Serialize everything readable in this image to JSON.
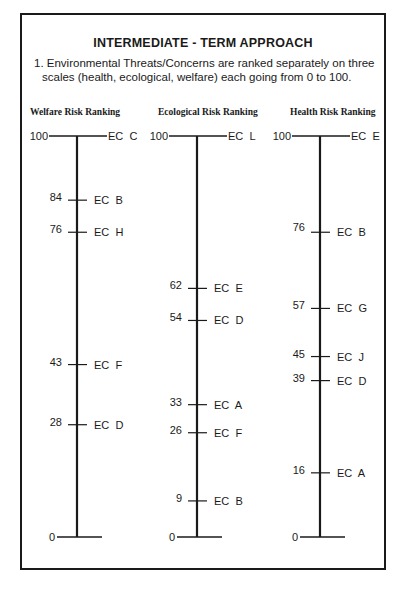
{
  "title": "INTERMEDIATE - TERM APPROACH",
  "description": {
    "line1": "1. Environmental Threats/Concerns are ranked separately on three",
    "line2": "scales (health, ecological, welfare) each going from 0 to 100."
  },
  "chart_data": {
    "type": "diagram",
    "title": "INTERMEDIATE - TERM APPROACH",
    "range": [
      0,
      100
    ],
    "scales": [
      {
        "name": "Welfare Risk Ranking",
        "items": [
          {
            "value": 100,
            "label": "EC  C"
          },
          {
            "value": 84,
            "label": "EC  B"
          },
          {
            "value": 76,
            "label": "EC  H"
          },
          {
            "value": 43,
            "label": "EC  F"
          },
          {
            "value": 28,
            "label": "EC  D"
          }
        ]
      },
      {
        "name": "Ecological Risk Ranking",
        "items": [
          {
            "value": 100,
            "label": "EC  L"
          },
          {
            "value": 62,
            "label": "EC  E"
          },
          {
            "value": 54,
            "label": "EC  D"
          },
          {
            "value": 33,
            "label": "EC  A"
          },
          {
            "value": 26,
            "label": "EC  F"
          },
          {
            "value": 9,
            "label": "EC  B"
          }
        ]
      },
      {
        "name": "Health Risk Ranking",
        "items": [
          {
            "value": 100,
            "label": "EC  E"
          },
          {
            "value": 76,
            "label": "EC  B"
          },
          {
            "value": 57,
            "label": "EC  G"
          },
          {
            "value": 45,
            "label": "EC  J"
          },
          {
            "value": 39,
            "label": "EC  D"
          },
          {
            "value": 16,
            "label": "EC  A"
          }
        ]
      }
    ],
    "zero_label": "0"
  }
}
